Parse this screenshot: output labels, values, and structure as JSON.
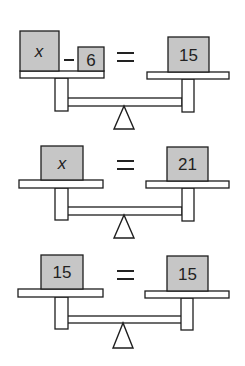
{
  "figure": {
    "title": "",
    "balances": [
      {
        "equation": "x - 6 = 15",
        "left": {
          "box1": "x",
          "operator": "−",
          "box2": "6"
        },
        "relation": "=",
        "right": {
          "box1": "15"
        }
      },
      {
        "equation": "x = 21",
        "left": {
          "box1": "x"
        },
        "relation": "=",
        "right": {
          "box1": "21"
        }
      },
      {
        "equation": "15 = 15",
        "left": {
          "box1": "15"
        },
        "relation": "=",
        "right": {
          "box1": "15"
        }
      }
    ],
    "colors": {
      "box_fill": "#c6c6c6",
      "stroke": "#1e1e1e",
      "background": "#ffffff"
    }
  }
}
